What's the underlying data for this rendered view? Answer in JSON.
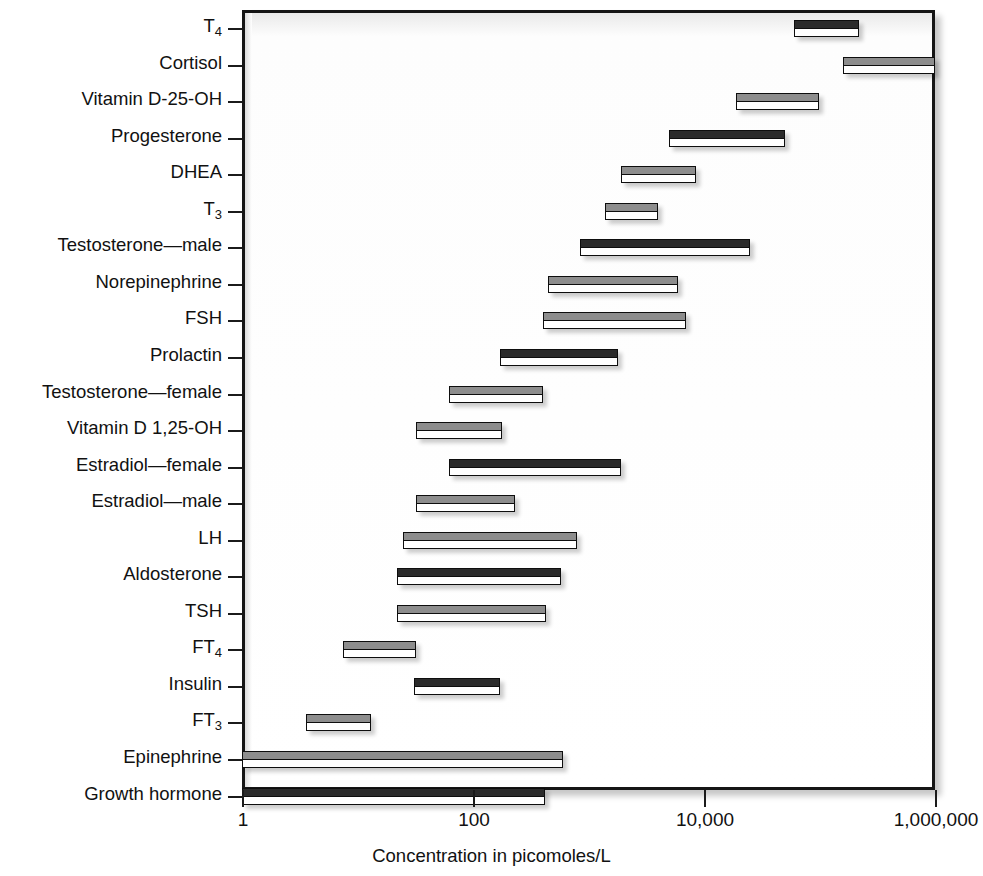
{
  "chart_data": {
    "type": "bar",
    "orientation": "horizontal",
    "subtype": "floating-range-bar",
    "title": "",
    "subtitle": "",
    "xlabel": "Concentration in picomoles/L",
    "ylabel": "",
    "xscale": "log",
    "xlim": [
      1,
      1000000
    ],
    "xticks": [
      1,
      100,
      10000,
      1000000
    ],
    "xticklabels": [
      "1",
      "100",
      "10,000",
      "1,000,000"
    ],
    "grid": false,
    "legend": null,
    "units": "picomoles/L",
    "note": "Each bar spans the low-to-high reference concentration range for that hormone.",
    "categories": [
      "T4",
      "Cortisol",
      "Vitamin D-25-OH",
      "Progesterone",
      "DHEA",
      "T3",
      "Testosterone—male",
      "Norepinephrine",
      "FSH",
      "Prolactin",
      "Testosterone—female",
      "Vitamin D 1,25-OH",
      "Estradiol—female",
      "Estradiol—male",
      "LH",
      "Aldosterone",
      "TSH",
      "FT4",
      "Insulin",
      "FT3",
      "Epinephrine",
      "Growth hormone"
    ],
    "series": [
      {
        "name": "Concentration range",
        "ranges": [
          {
            "category": "T4",
            "label_main": "T",
            "label_sub": "4",
            "low": 60000,
            "high": 220000,
            "shade": "dark"
          },
          {
            "category": "Cortisol",
            "label_main": "Cortisol",
            "label_sub": "",
            "low": 160000,
            "high": 1000000,
            "shade": "light"
          },
          {
            "category": "Vitamin D-25-OH",
            "label_main": "Vitamin D-25-OH",
            "label_sub": "",
            "low": 19000,
            "high": 100000,
            "shade": "light"
          },
          {
            "category": "Progesterone",
            "label_main": "Progesterone",
            "label_sub": "",
            "low": 5000,
            "high": 50000,
            "shade": "dark"
          },
          {
            "category": "DHEA",
            "label_main": "DHEA",
            "label_sub": "",
            "low": 1900,
            "high": 8500,
            "shade": "light"
          },
          {
            "category": "T3",
            "label_main": "T",
            "label_sub": "3",
            "low": 1400,
            "high": 4000,
            "shade": "light"
          },
          {
            "category": "Testosterone—male",
            "label_main": "Testosterone—male",
            "label_sub": "",
            "low": 850,
            "high": 25000,
            "shade": "dark"
          },
          {
            "category": "Norepinephrine",
            "label_main": "Norepinephrine",
            "label_sub": "",
            "low": 450,
            "high": 6000,
            "shade": "light"
          },
          {
            "category": "FSH",
            "label_main": "FSH",
            "label_sub": "",
            "low": 400,
            "high": 7000,
            "shade": "light"
          },
          {
            "category": "Prolactin",
            "label_main": "Prolactin",
            "label_sub": "",
            "low": 170,
            "high": 1800,
            "shade": "dark"
          },
          {
            "category": "Testosterone—female",
            "label_main": "Testosterone—female",
            "label_sub": "",
            "low": 62,
            "high": 400,
            "shade": "light"
          },
          {
            "category": "Vitamin D 1,25-OH",
            "label_main": "Vitamin D 1,25-OH",
            "label_sub": "",
            "low": 32,
            "high": 180,
            "shade": "light"
          },
          {
            "category": "Estradiol—female",
            "label_main": "Estradiol—female",
            "label_sub": "",
            "low": 62,
            "high": 1900,
            "shade": "dark"
          },
          {
            "category": "Estradiol—male",
            "label_main": "Estradiol—male",
            "label_sub": "",
            "low": 32,
            "high": 230,
            "shade": "light"
          },
          {
            "category": "LH",
            "label_main": "LH",
            "label_sub": "",
            "low": 25,
            "high": 800,
            "shade": "light"
          },
          {
            "category": "Aldosterone",
            "label_main": "Aldosterone",
            "label_sub": "",
            "low": 22,
            "high": 580,
            "shade": "dark"
          },
          {
            "category": "TSH",
            "label_main": "TSH",
            "label_sub": "",
            "low": 22,
            "high": 430,
            "shade": "light"
          },
          {
            "category": "FT4",
            "label_main": "FT",
            "label_sub": "4",
            "low": 7.5,
            "high": 32,
            "shade": "light"
          },
          {
            "category": "Insulin",
            "label_main": "Insulin",
            "label_sub": "",
            "low": 31,
            "high": 170,
            "shade": "dark"
          },
          {
            "category": "FT3",
            "label_main": "FT",
            "label_sub": "3",
            "low": 3.6,
            "high": 13,
            "shade": "light"
          },
          {
            "category": "Epinephrine",
            "label_main": "Epinephrine",
            "label_sub": "",
            "low": 1,
            "high": 600,
            "shade": "light"
          },
          {
            "category": "Growth hormone",
            "label_main": "Growth hormone",
            "label_sub": "",
            "low": 1,
            "high": 420,
            "shade": "dark"
          }
        ]
      }
    ]
  },
  "axis": {
    "x_title": "Concentration in picomoles/L",
    "tick_labels": [
      "1",
      "100",
      "10,000",
      "1,000,000"
    ],
    "tick_values": [
      1,
      100,
      10000,
      1000000
    ]
  },
  "colors": {
    "bar_outline": "#0e0e0e",
    "bar_fill_dark": "#2b2b2b",
    "bar_fill_light": "#8d8d8d",
    "bar_body": "#ffffff",
    "frame": "#151515",
    "plot_background": "#ffffff",
    "text": "#111111"
  }
}
